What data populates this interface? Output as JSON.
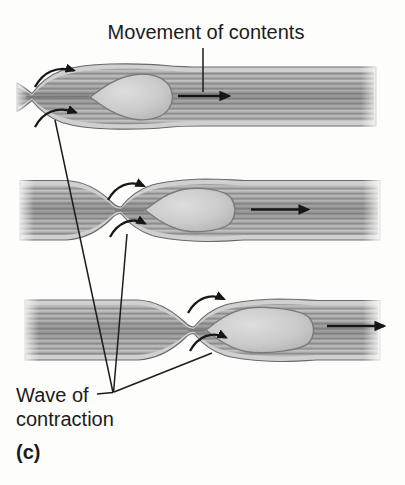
{
  "labels": {
    "movement_of_contents": "Movement of contents",
    "wave_of_contraction_line1": "Wave of",
    "wave_of_contraction_line2": "contraction",
    "panel_letter": "(c)"
  },
  "icons": {
    "movement_arrow": "right-arrow",
    "contraction_arrow": "curved-right-arrow"
  },
  "colors": {
    "background": "#fdfdfc",
    "text": "#1b1b1b",
    "arrow_ink": "#161616",
    "tube_outline": "#6a6a6a",
    "tube_outer_layer": "#d0d0d0",
    "muscle_base": "#a8a8a8",
    "muscle_striation_light": "#c3c3c3",
    "muscle_striation_dark": "#8e8e8e",
    "bolus_fill": "#c9c9c9",
    "bolus_rim": "#7a7a7a"
  }
}
